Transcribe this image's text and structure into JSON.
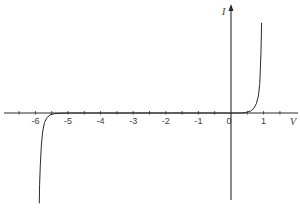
{
  "chart_data": {
    "type": "line",
    "title": "",
    "xlabel": "V",
    "ylabel": "I",
    "xlim": [
      -7.0,
      2.1
    ],
    "ylim": [
      -1.0,
      1.0
    ],
    "grid": false,
    "legend": null,
    "x_ticks": [
      -6,
      -5,
      -4,
      -3,
      -2,
      -1,
      0,
      1
    ],
    "x_tick_labels": [
      "-6",
      "-5",
      "-4",
      "-3",
      "-2",
      "-1",
      "0",
      "1"
    ],
    "minor_ticks_every": 0.5,
    "series": [
      {
        "name": "forward-bias",
        "description": "Diode forward conduction, current rises sharply near 0.9 V",
        "x": [
          0.0,
          0.3,
          0.45,
          0.6,
          0.7,
          0.78,
          0.84,
          0.88,
          0.9,
          0.92,
          0.93,
          0.94
        ],
        "y": [
          0.0,
          0.0,
          0.005,
          0.02,
          0.05,
          0.1,
          0.18,
          0.3,
          0.45,
          0.65,
          0.8,
          0.95
        ]
      },
      {
        "name": "reverse-breakdown",
        "description": "Zener breakdown near -5.7 V, current drops sharply negative",
        "x": [
          0.0,
          -5.0,
          -5.4,
          -5.55,
          -5.65,
          -5.72,
          -5.78,
          -5.82,
          -5.85,
          -5.87,
          -5.88
        ],
        "y": [
          0.0,
          0.0,
          -0.005,
          -0.02,
          -0.05,
          -0.1,
          -0.2,
          -0.35,
          -0.55,
          -0.75,
          -0.95
        ]
      }
    ],
    "colors": {
      "axis": "#2a2a2a",
      "curve": "#2a2a2a",
      "label": "#3a3a3a"
    }
  }
}
